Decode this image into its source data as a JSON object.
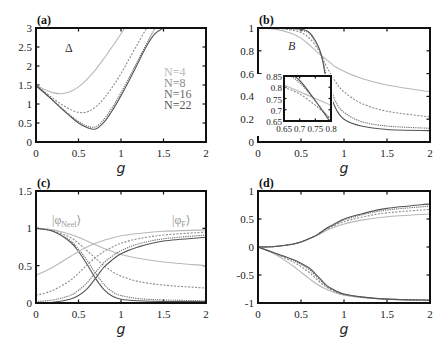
{
  "figure": {
    "series_styles": {
      "N=4": {
        "color": "#b8b8b8",
        "dash": ""
      },
      "N=8": {
        "color": "#8c8c8c",
        "dash": "2,1.5"
      },
      "N=16": {
        "color": "#6a6a6a",
        "dash": "1.2,1"
      },
      "N=22": {
        "color": "#555555",
        "dash": ""
      }
    }
  },
  "chart_data": [
    {
      "panel": "(a)",
      "type": "line",
      "title": "",
      "annotation": "Δ",
      "xlabel": "g",
      "ylabel": "",
      "xlim": [
        0,
        2
      ],
      "ylim": [
        0,
        3
      ],
      "xticks": [
        "0",
        "0.5",
        "1",
        "1.5",
        "2"
      ],
      "yticks": [
        "0",
        "0.5",
        "1",
        "1.5",
        "2",
        "2.5",
        "3"
      ],
      "legend": [
        "N=4",
        "N=8",
        "N=16",
        "N=22"
      ],
      "legend_position": "right-middle",
      "x": [
        0,
        0.1,
        0.2,
        0.3,
        0.4,
        0.5,
        0.6,
        0.7,
        0.8,
        0.9,
        1.0,
        1.1,
        1.2,
        1.3,
        1.4,
        1.5
      ],
      "series": [
        {
          "name": "N=4",
          "values": [
            1.5,
            1.38,
            1.3,
            1.27,
            1.32,
            1.45,
            1.65,
            1.9,
            2.2,
            2.52,
            2.85,
            3.2,
            null,
            null,
            null,
            null
          ]
        },
        {
          "name": "N=8",
          "values": [
            1.5,
            1.32,
            1.15,
            0.99,
            0.86,
            0.78,
            0.79,
            0.92,
            1.15,
            1.45,
            1.8,
            2.2,
            2.6,
            3.0,
            null,
            null
          ]
        },
        {
          "name": "N=16",
          "values": [
            1.48,
            1.3,
            1.1,
            0.9,
            0.71,
            0.54,
            0.42,
            0.4,
            0.6,
            0.92,
            1.3,
            1.72,
            2.15,
            2.58,
            3.0,
            null
          ]
        },
        {
          "name": "N=22",
          "values": [
            1.48,
            1.29,
            1.09,
            0.88,
            0.68,
            0.5,
            0.38,
            0.34,
            0.52,
            0.84,
            1.22,
            1.64,
            2.08,
            2.52,
            2.85,
            3.0
          ]
        }
      ]
    },
    {
      "panel": "(b)",
      "type": "line",
      "annotation": "B",
      "xlabel": "g",
      "ylabel": "",
      "xlim": [
        0,
        2
      ],
      "ylim": [
        0,
        1
      ],
      "xticks": [
        "0",
        "0.5",
        "1",
        "1.5",
        "2"
      ],
      "yticks": [
        "0",
        "0.2",
        "0.4",
        "0.6",
        "0.8",
        "1"
      ],
      "x": [
        0,
        0.2,
        0.4,
        0.5,
        0.6,
        0.7,
        0.75,
        0.8,
        0.9,
        1.0,
        1.2,
        1.5,
        2.0
      ],
      "series": [
        {
          "name": "N=4",
          "values": [
            1.0,
            0.99,
            0.95,
            0.91,
            0.85,
            0.78,
            0.75,
            0.72,
            0.66,
            0.62,
            0.56,
            0.5,
            0.44
          ]
        },
        {
          "name": "N=8",
          "values": [
            1.0,
            1.0,
            0.98,
            0.96,
            0.91,
            0.81,
            0.74,
            0.66,
            0.53,
            0.44,
            0.34,
            0.27,
            0.22
          ]
        },
        {
          "name": "N=16",
          "values": [
            1.0,
            1.0,
            0.99,
            0.98,
            0.95,
            0.83,
            0.73,
            0.57,
            0.36,
            0.26,
            0.18,
            0.14,
            0.12
          ]
        },
        {
          "name": "N=22",
          "values": [
            1.0,
            1.0,
            1.0,
            0.99,
            0.96,
            0.84,
            0.72,
            0.52,
            0.3,
            0.2,
            0.14,
            0.11,
            0.1
          ]
        }
      ],
      "inset": {
        "xlim": [
          0.65,
          0.8
        ],
        "ylim": [
          0.65,
          0.85
        ],
        "xticks": [
          "0.65",
          "0.7",
          "0.75",
          "0.8"
        ],
        "yticks": [
          "0.65",
          "0.7",
          "0.75",
          "0.8",
          "0.85"
        ],
        "x": [
          0.65,
          0.7,
          0.75,
          0.8
        ],
        "series": [
          {
            "name": "N=4",
            "values": [
              0.81,
              0.78,
              0.75,
              0.72
            ]
          },
          {
            "name": "N=8",
            "values": [
              0.8,
              0.77,
              0.72,
              0.66
            ]
          },
          {
            "name": "N=16",
            "values": [
              0.87,
              0.82,
              0.74,
              0.65
            ]
          },
          {
            "name": "N=22",
            "values": [
              0.88,
              0.83,
              0.74,
              0.64
            ]
          }
        ]
      }
    },
    {
      "panel": "(c)",
      "type": "line",
      "xlabel": "g",
      "ylabel": "",
      "xlim": [
        0,
        2
      ],
      "ylim": [
        0,
        1.5
      ],
      "xticks": [
        "0",
        "0.5",
        "1",
        "1.5",
        "2"
      ],
      "yticks": [
        "0",
        "0.5",
        "1",
        "1.5"
      ],
      "annotations": [
        "|φNeel⟩",
        "|φF⟩"
      ],
      "x": [
        0,
        0.2,
        0.4,
        0.5,
        0.6,
        0.7,
        0.8,
        0.9,
        1.0,
        1.2,
        1.5,
        2.0
      ],
      "series": [
        {
          "name": "Neel N=4",
          "values": [
            1.0,
            0.98,
            0.92,
            0.88,
            0.83,
            0.78,
            0.73,
            0.69,
            0.65,
            0.6,
            0.55,
            0.5
          ]
        },
        {
          "name": "Neel N=8",
          "values": [
            1.0,
            0.97,
            0.88,
            0.8,
            0.7,
            0.6,
            0.5,
            0.42,
            0.36,
            0.29,
            0.24,
            0.2
          ]
        },
        {
          "name": "Neel N=16",
          "values": [
            1.0,
            0.96,
            0.84,
            0.72,
            0.57,
            0.4,
            0.25,
            0.15,
            0.1,
            0.06,
            0.04,
            0.03
          ]
        },
        {
          "name": "Neel N=22",
          "values": [
            1.0,
            0.96,
            0.82,
            0.69,
            0.52,
            0.33,
            0.18,
            0.09,
            0.05,
            0.03,
            0.02,
            0.02
          ]
        },
        {
          "name": "F N=4",
          "values": [
            0.37,
            0.48,
            0.62,
            0.69,
            0.75,
            0.8,
            0.84,
            0.87,
            0.9,
            0.93,
            0.96,
            0.98
          ]
        },
        {
          "name": "F N=8",
          "values": [
            0.1,
            0.17,
            0.3,
            0.4,
            0.51,
            0.61,
            0.69,
            0.75,
            0.8,
            0.86,
            0.91,
            0.95
          ]
        },
        {
          "name": "F N=16",
          "values": [
            0.02,
            0.04,
            0.1,
            0.17,
            0.27,
            0.41,
            0.54,
            0.63,
            0.7,
            0.79,
            0.86,
            0.91
          ]
        },
        {
          "name": "F N=22",
          "values": [
            0.0,
            0.01,
            0.05,
            0.1,
            0.19,
            0.33,
            0.48,
            0.58,
            0.66,
            0.75,
            0.83,
            0.88
          ]
        }
      ]
    },
    {
      "panel": "(d)",
      "type": "line",
      "xlabel": "g",
      "ylabel": "",
      "xlim": [
        0,
        2
      ],
      "ylim": [
        -1,
        1
      ],
      "xticks": [
        "0",
        "0.5",
        "1",
        "1.5",
        "2"
      ],
      "yticks": [
        "-1",
        "-0.5",
        "0",
        "0.5",
        "1"
      ],
      "x": [
        0,
        0.2,
        0.4,
        0.5,
        0.6,
        0.7,
        0.8,
        0.9,
        1.0,
        1.2,
        1.5,
        2.0
      ],
      "series": [
        {
          "name": "upper N=4",
          "values": [
            0,
            0.01,
            0.05,
            0.09,
            0.15,
            0.22,
            0.3,
            0.36,
            0.41,
            0.48,
            0.54,
            0.59
          ]
        },
        {
          "name": "upper N=8",
          "values": [
            0,
            0.01,
            0.05,
            0.09,
            0.15,
            0.22,
            0.32,
            0.39,
            0.45,
            0.53,
            0.61,
            0.67
          ]
        },
        {
          "name": "upper N=16",
          "values": [
            0,
            0.01,
            0.05,
            0.09,
            0.15,
            0.23,
            0.33,
            0.41,
            0.48,
            0.57,
            0.66,
            0.73
          ]
        },
        {
          "name": "upper N=22",
          "values": [
            0,
            0.01,
            0.05,
            0.09,
            0.15,
            0.23,
            0.34,
            0.42,
            0.5,
            0.59,
            0.69,
            0.77
          ]
        },
        {
          "name": "lower N=4",
          "values": [
            0,
            -0.13,
            -0.33,
            -0.45,
            -0.57,
            -0.68,
            -0.76,
            -0.82,
            -0.86,
            -0.9,
            -0.93,
            -0.95
          ]
        },
        {
          "name": "lower N=8",
          "values": [
            0,
            -0.12,
            -0.26,
            -0.35,
            -0.46,
            -0.6,
            -0.72,
            -0.8,
            -0.85,
            -0.9,
            -0.93,
            -0.95
          ]
        },
        {
          "name": "lower N=16",
          "values": [
            0,
            -0.11,
            -0.23,
            -0.31,
            -0.41,
            -0.56,
            -0.7,
            -0.79,
            -0.84,
            -0.89,
            -0.93,
            -0.95
          ]
        },
        {
          "name": "lower N=22",
          "values": [
            0,
            -0.11,
            -0.22,
            -0.29,
            -0.38,
            -0.53,
            -0.69,
            -0.78,
            -0.84,
            -0.89,
            -0.93,
            -0.95
          ]
        }
      ]
    }
  ]
}
